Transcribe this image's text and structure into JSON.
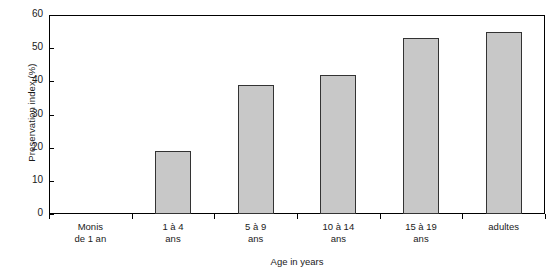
{
  "chart_data": {
    "type": "bar",
    "title": "",
    "xlabel": "Age in years",
    "ylabel": "Preservation index (%)",
    "categories": [
      "Monis de 1 an",
      "1 à 4 ans",
      "5 à 9 ans",
      "10 à 14 ans",
      "15 à 19 ans",
      "adultes"
    ],
    "category_lines": [
      [
        "Monis",
        "de 1 an"
      ],
      [
        "1 à 4",
        "ans"
      ],
      [
        "5 à 9",
        "ans"
      ],
      [
        "10 à 14",
        "ans"
      ],
      [
        "15 à 19",
        "ans"
      ],
      [
        "adultes",
        ""
      ]
    ],
    "values": [
      0,
      19,
      39,
      42,
      53,
      55
    ],
    "ylim": [
      0,
      60
    ],
    "ytick_values": [
      0,
      10,
      20,
      30,
      40,
      50,
      60
    ],
    "ytick_labels": [
      "0",
      "10",
      "20",
      "30",
      "40",
      "50",
      "60"
    ],
    "grid": false,
    "legend": null,
    "bar_fill_color": "#c8c8c8",
    "bar_edge_color": "#333333",
    "axis_color": "#000000",
    "background_color": "#ffffff"
  }
}
